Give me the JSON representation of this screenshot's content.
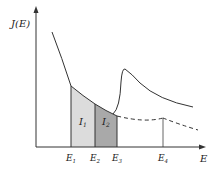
{
  "figure": {
    "y_axis_label": "J(E)",
    "x_axis_label": "E",
    "tick_labels": [
      "E1",
      "E2",
      "E3",
      "E4"
    ],
    "tick_label_parts": [
      {
        "main": "E",
        "sub": "1"
      },
      {
        "main": "E",
        "sub": "2"
      },
      {
        "main": "E",
        "sub": "3"
      },
      {
        "main": "E",
        "sub": "4"
      }
    ],
    "regions": [
      {
        "label_main": "I",
        "label_sub": "1",
        "from": "E1",
        "to": "E2",
        "fill": "#dcdcdc"
      },
      {
        "label_main": "I",
        "label_sub": "2",
        "from": "E2",
        "to": "E3",
        "fill": "#a9a9a9"
      }
    ],
    "curves": {
      "solid_background": "decaying curve from top-left down to E3",
      "edge_peak": "sharp rise at E3, peak then decay (solid)",
      "extrapolated_background": "dashed continuation beyond E3"
    },
    "colors": {
      "line": "#333333",
      "region1": "#dcdcdc",
      "region2": "#a9a9a9"
    }
  }
}
